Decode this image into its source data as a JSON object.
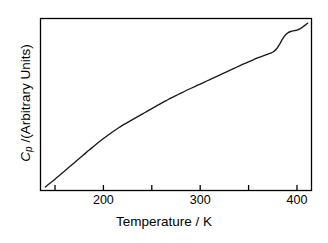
{
  "figure": {
    "background_color": "#ffffff",
    "line_color": "#1a1a1a",
    "axis_color": "#000000"
  },
  "axes": {
    "x_title": "Temperature / K",
    "y_title_prefix": "C",
    "y_title_subscript": "p",
    "y_title_suffix": " /(Arbitrary Units)",
    "y_title_full": "Cp /(Arbitrary Units)"
  },
  "chart_data": {
    "type": "line",
    "title": "",
    "subtitle": "",
    "xlabel": "Temperature / K",
    "ylabel": "Cp /(Arbitrary Units)",
    "xlim": [
      135,
      415
    ],
    "ylim": [
      0,
      100
    ],
    "grid": false,
    "legend": null,
    "legend_position": "none",
    "x_major_ticks": [
      150,
      200,
      250,
      300,
      350,
      400
    ],
    "x_tick_labels": [
      "",
      "200",
      "",
      "300",
      "",
      "400"
    ],
    "x_labeled_ticks": [
      {
        "value": 200,
        "label": "200"
      },
      {
        "value": 300,
        "label": "300"
      },
      {
        "value": 400,
        "label": "400"
      }
    ],
    "y_major_ticks": [],
    "y_tick_labels": [],
    "y_axis_has_ticks": false,
    "annotations": [
      {
        "text": "heat capacity step (glass/phase transition)",
        "x_range": [
          372,
          392
        ]
      }
    ],
    "series": [
      {
        "name": "Cp",
        "x": [
          140,
          145,
          150,
          155,
          160,
          165,
          170,
          175,
          180,
          185,
          190,
          195,
          200,
          205,
          210,
          215,
          220,
          225,
          230,
          235,
          240,
          245,
          250,
          255,
          260,
          265,
          270,
          275,
          280,
          285,
          290,
          295,
          300,
          305,
          310,
          315,
          320,
          325,
          330,
          335,
          340,
          345,
          350,
          355,
          360,
          365,
          370,
          373,
          376,
          379,
          382,
          385,
          388,
          391,
          394,
          397,
          400,
          403,
          406,
          409,
          411
        ],
        "y": [
          2.0,
          4.3,
          6.6,
          9.0,
          11.4,
          13.8,
          16.2,
          18.6,
          21.0,
          23.4,
          25.7,
          28.0,
          30.2,
          32.3,
          34.3,
          36.2,
          38.0,
          39.6,
          41.2,
          42.8,
          44.4,
          46.0,
          47.6,
          49.2,
          50.8,
          52.3,
          53.8,
          55.2,
          56.6,
          58.0,
          59.3,
          60.6,
          61.9,
          63.2,
          64.5,
          65.8,
          67.1,
          68.4,
          69.7,
          71.0,
          72.3,
          73.6,
          74.8,
          76.0,
          77.2,
          78.3,
          79.3,
          79.9,
          80.8,
          82.4,
          85.0,
          88.0,
          90.4,
          91.8,
          92.5,
          92.9,
          93.3,
          94.0,
          95.1,
          96.4,
          97.3
        ]
      }
    ]
  }
}
